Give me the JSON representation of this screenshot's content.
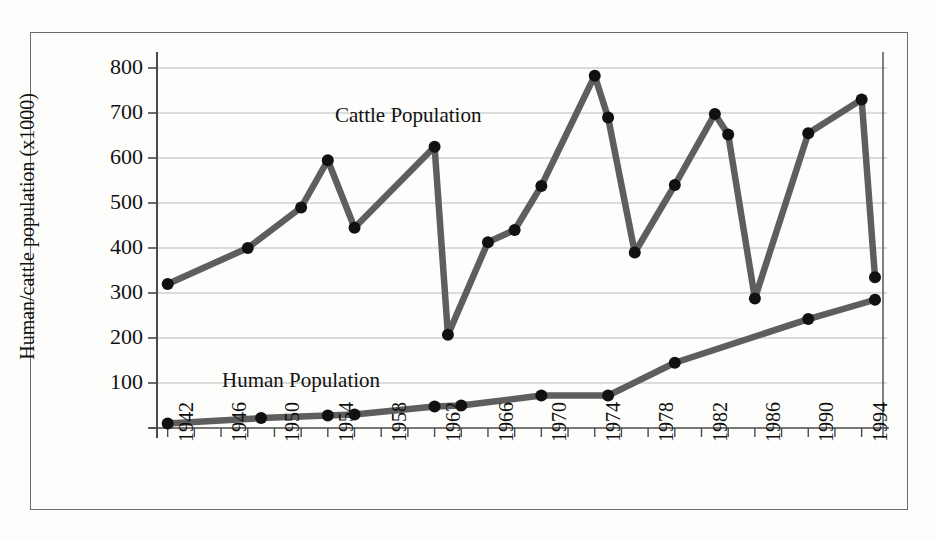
{
  "figure": {
    "background_color": "#fdfdfc",
    "border_color": "#6d6d6d",
    "line_color": "#5e5e5e",
    "marker_color": "#111111",
    "grid_color": "#b9b9b9",
    "axis_color": "#4a4a4a"
  },
  "axes": {
    "ylabel": "Human/cattle population (x1000)",
    "xlabel": "",
    "y_ticks": [
      0,
      100,
      200,
      300,
      400,
      500,
      600,
      700,
      800
    ],
    "y_tick_labels": [
      "",
      "100",
      "200",
      "300",
      "400",
      "500",
      "600",
      "700",
      "800"
    ],
    "ylim": [
      0,
      820
    ],
    "xlim": [
      1941.2,
      1995.6
    ],
    "x_tick_labels": [
      "1942",
      "1946",
      "1950",
      "1954",
      "1958",
      "1962",
      "1966",
      "1970",
      "1974",
      "1978",
      "1982",
      "1986",
      "1990",
      "1994"
    ],
    "x_tick_values": [
      1942,
      1946,
      1950,
      1954,
      1958,
      1962,
      1966,
      1970,
      1974,
      1978,
      1982,
      1986,
      1990,
      1994
    ],
    "x_minor_step": 2,
    "grid": "horizontal"
  },
  "annotations": {
    "cattle_label": "Cattle Population",
    "human_label": "Human Population"
  },
  "chart_data": {
    "type": "line",
    "title": "",
    "xlabel": "",
    "ylabel": "Human/cattle population (x1000)",
    "xlim": [
      1941.2,
      1995.6
    ],
    "ylim": [
      0,
      820
    ],
    "grid": true,
    "legend_position": "inline-annotation",
    "series": [
      {
        "name": "Cattle Population",
        "x": [
          1942,
          1948,
          1952,
          1954,
          1956,
          1962,
          1963,
          1966,
          1968,
          1970,
          1974,
          1975,
          1977,
          1980,
          1983,
          1984,
          1986,
          1990,
          1994,
          1995
        ],
        "values": [
          320,
          400,
          490,
          595,
          445,
          625,
          207,
          413,
          440,
          538,
          783,
          690,
          390,
          540,
          698,
          652,
          288,
          655,
          730,
          335
        ]
      },
      {
        "name": "Human Population",
        "x": [
          1942,
          1949,
          1954,
          1956,
          1962,
          1964,
          1970,
          1975,
          1980,
          1990,
          1995
        ],
        "values": [
          10,
          22,
          28,
          30,
          48,
          50,
          72,
          72,
          145,
          242,
          285
        ]
      }
    ]
  }
}
